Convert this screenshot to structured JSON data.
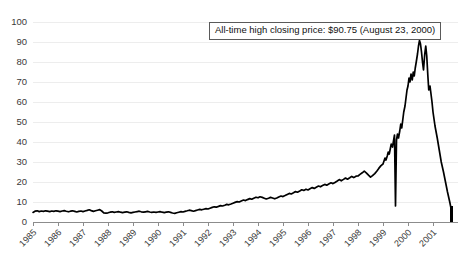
{
  "chart_data": {
    "type": "line",
    "title": "",
    "xlabel": "",
    "ylabel": "",
    "ylim": [
      0,
      100
    ],
    "ytick_values": [
      0,
      10,
      20,
      30,
      40,
      50,
      60,
      70,
      80,
      90,
      100
    ],
    "ytick_labels": [
      "0",
      "10",
      "20",
      "30",
      "40",
      "50",
      "60",
      "70",
      "80",
      "90",
      "100"
    ],
    "xtick_labels": [
      "1985",
      "1986",
      "1987",
      "1988",
      "1989",
      "1990",
      "1991",
      "1992",
      "1993",
      "1994",
      "1995",
      "1996",
      "1997",
      "1998",
      "1999",
      "2000",
      "2001"
    ],
    "xlim": [
      1985,
      2002
    ],
    "grid": true,
    "legend": null,
    "annotations": [
      {
        "text": "All-time high closing price: $90.75 (August 23, 2000)",
        "value": 90.75,
        "date": "August 23, 2000"
      }
    ],
    "series": [
      {
        "name": "closing price",
        "color": "#000000",
        "x": [
          1985.0,
          1985.08,
          1985.17,
          1985.25,
          1985.33,
          1985.42,
          1985.5,
          1985.58,
          1985.67,
          1985.75,
          1985.83,
          1985.92,
          1986.0,
          1986.08,
          1986.17,
          1986.25,
          1986.33,
          1986.42,
          1986.5,
          1986.58,
          1986.67,
          1986.75,
          1986.83,
          1986.92,
          1987.0,
          1987.08,
          1987.17,
          1987.25,
          1987.33,
          1987.42,
          1987.5,
          1987.58,
          1987.67,
          1987.75,
          1987.83,
          1987.92,
          1988.0,
          1988.08,
          1988.17,
          1988.25,
          1988.33,
          1988.42,
          1988.5,
          1988.58,
          1988.67,
          1988.75,
          1988.83,
          1988.92,
          1989.0,
          1989.08,
          1989.17,
          1989.25,
          1989.33,
          1989.42,
          1989.5,
          1989.58,
          1989.67,
          1989.75,
          1989.83,
          1989.92,
          1990.0,
          1990.08,
          1990.17,
          1990.25,
          1990.33,
          1990.42,
          1990.5,
          1990.58,
          1990.67,
          1990.75,
          1990.83,
          1990.92,
          1991.0,
          1991.08,
          1991.17,
          1991.25,
          1991.33,
          1991.42,
          1991.5,
          1991.58,
          1991.67,
          1991.75,
          1991.83,
          1991.92,
          1992.0,
          1992.08,
          1992.17,
          1992.25,
          1992.33,
          1992.42,
          1992.5,
          1992.58,
          1992.67,
          1992.75,
          1992.83,
          1992.92,
          1993.0,
          1993.08,
          1993.17,
          1993.25,
          1993.33,
          1993.42,
          1993.5,
          1993.58,
          1993.67,
          1993.75,
          1993.83,
          1993.92,
          1994.0,
          1994.08,
          1994.17,
          1994.25,
          1994.33,
          1994.42,
          1994.5,
          1994.58,
          1994.67,
          1994.75,
          1994.83,
          1994.92,
          1995.0,
          1995.08,
          1995.17,
          1995.25,
          1995.33,
          1995.42,
          1995.5,
          1995.58,
          1995.67,
          1995.75,
          1995.83,
          1995.92,
          1996.0,
          1996.08,
          1996.17,
          1996.25,
          1996.33,
          1996.42,
          1996.5,
          1996.58,
          1996.67,
          1996.75,
          1996.83,
          1996.92,
          1997.0,
          1997.08,
          1997.17,
          1997.25,
          1997.33,
          1997.42,
          1997.5,
          1997.58,
          1997.67,
          1997.75,
          1997.83,
          1997.92,
          1998.0,
          1998.08,
          1998.17,
          1998.25,
          1998.33,
          1998.42,
          1998.5,
          1998.58,
          1998.67,
          1998.75,
          1998.83,
          1998.92,
          1999.0,
          1999.04,
          1999.08,
          1999.12,
          1999.17,
          1999.21,
          1999.25,
          1999.29,
          1999.33,
          1999.38,
          1999.42,
          1999.46,
          1999.5,
          1999.54,
          1999.58,
          1999.62,
          1999.67,
          1999.71,
          1999.75,
          1999.79,
          1999.83,
          1999.88,
          1999.92,
          1999.96,
          2000.0,
          2000.04,
          2000.08,
          2000.12,
          2000.17,
          2000.21,
          2000.25,
          2000.29,
          2000.33,
          2000.38,
          2000.42,
          2000.46,
          2000.5,
          2000.54,
          2000.58,
          2000.62,
          2000.67,
          2000.71,
          2000.75,
          2000.79,
          2000.83,
          2000.88,
          2000.92,
          2000.96,
          2001.0,
          2001.08,
          2001.17,
          2001.25,
          2001.33,
          2001.42,
          2001.5,
          2001.58,
          2001.67,
          2001.75
        ],
        "y": [
          4.8,
          5.4,
          5.6,
          5.2,
          5.5,
          5.3,
          5.6,
          5.4,
          5.2,
          5.5,
          5.3,
          5.6,
          5.4,
          5.2,
          5.5,
          5.7,
          5.4,
          5.1,
          5.4,
          5.6,
          5.3,
          5.0,
          5.3,
          5.5,
          5.2,
          5.5,
          5.8,
          6.1,
          5.7,
          5.3,
          5.6,
          5.9,
          6.2,
          5.5,
          4.6,
          4.4,
          4.6,
          4.9,
          5.1,
          4.8,
          5.0,
          5.2,
          4.9,
          4.7,
          4.9,
          5.1,
          4.8,
          4.6,
          4.8,
          5.0,
          5.2,
          5.4,
          5.1,
          4.9,
          5.1,
          5.3,
          5.0,
          4.8,
          5.0,
          4.8,
          5.0,
          5.2,
          4.9,
          4.7,
          4.9,
          5.1,
          4.8,
          4.5,
          4.3,
          4.6,
          4.9,
          5.2,
          5.0,
          5.3,
          5.6,
          5.9,
          5.7,
          5.4,
          5.7,
          6.0,
          6.3,
          6.1,
          6.4,
          6.7,
          6.5,
          6.9,
          7.3,
          7.6,
          7.4,
          7.8,
          8.2,
          8.0,
          8.4,
          8.8,
          8.6,
          9.0,
          9.4,
          9.8,
          10.2,
          10.0,
          10.5,
          11.0,
          10.7,
          11.2,
          11.7,
          11.4,
          11.9,
          12.4,
          12.1,
          12.6,
          12.3,
          11.9,
          11.5,
          11.9,
          12.3,
          12.0,
          11.6,
          12.0,
          12.5,
          13.0,
          12.7,
          13.2,
          13.8,
          14.3,
          14.0,
          14.6,
          15.2,
          14.9,
          15.5,
          16.1,
          15.8,
          16.4,
          16.0,
          16.6,
          17.2,
          16.8,
          17.4,
          18.0,
          17.6,
          18.2,
          18.8,
          18.4,
          19.0,
          19.6,
          19.2,
          19.8,
          20.5,
          21.2,
          20.6,
          21.3,
          22.0,
          21.4,
          22.1,
          22.8,
          22.2,
          22.9,
          23.0,
          23.8,
          24.6,
          25.4,
          24.6,
          23.4,
          22.4,
          23.2,
          24.2,
          25.4,
          26.8,
          28.2,
          29.0,
          30.5,
          32.0,
          31.0,
          33.0,
          35.0,
          34.0,
          36.5,
          39.0,
          37.5,
          40.5,
          43.5,
          8.0,
          41.0,
          44.0,
          42.0,
          45.5,
          49.0,
          47.0,
          51.0,
          55.0,
          58.0,
          62.0,
          66.0,
          68.0,
          72.0,
          70.0,
          74.0,
          71.0,
          75.0,
          73.0,
          77.0,
          80.0,
          84.0,
          88.0,
          90.75,
          89.0,
          85.0,
          80.0,
          76.0,
          84.0,
          88.0,
          83.0,
          74.0,
          66.0,
          68.0,
          64.0,
          60.0,
          55.0,
          48.0,
          42.0,
          36.0,
          30.0,
          25.0,
          20.0,
          15.0,
          10.0,
          5.0
        ]
      }
    ]
  },
  "axis": {
    "y_label_text": "",
    "x_label_text": ""
  }
}
